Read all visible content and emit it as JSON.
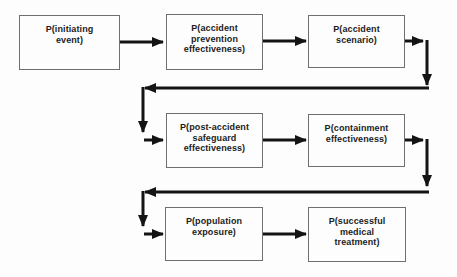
{
  "diagram": {
    "boxes": [
      {
        "name": "initiating-event",
        "label": "P(initiating\nevent)"
      },
      {
        "name": "accident-prevention-effectiveness",
        "label": "P(accident\nprevention\neffectiveness)"
      },
      {
        "name": "accident-scenario",
        "label": "P(accident\nscenario)"
      },
      {
        "name": "post-accident-safeguard-effectiveness",
        "label": "P(post-accident\nsafeguard\neffectiveness)"
      },
      {
        "name": "containment-effectiveness",
        "label": "P(containment\neffectiveness)"
      },
      {
        "name": "population-exposure",
        "label": "P(population\nexposure)"
      },
      {
        "name": "successful-medical-treatment",
        "label": "P(successful\nmedical\ntreatment)"
      }
    ],
    "colors": {
      "background": "#fdfdfd",
      "box_border": "#6f6f6f",
      "text": "#1c1c1c",
      "arrow": "#141414"
    }
  }
}
